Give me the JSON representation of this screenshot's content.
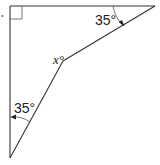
{
  "diagram": {
    "type": "geometry-angle-figure",
    "colors": {
      "line": "#333333",
      "background": "#ffffff",
      "text": "#222222"
    },
    "labels": {
      "top_angle": "35°",
      "bottom_angle": "35°",
      "unknown_angle": "x°"
    },
    "marks": {
      "right_angle": "right-angle at top-left corner"
    },
    "points": {
      "top_left": [
        10,
        6
      ],
      "top_right": [
        155,
        6
      ],
      "bottom_left": [
        10,
        158
      ],
      "bend": [
        63,
        61
      ]
    }
  }
}
